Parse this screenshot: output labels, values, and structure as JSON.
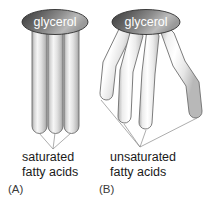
{
  "figure": {
    "background_color": "#ffffff",
    "width": 207,
    "height": 205
  },
  "panels": [
    {
      "id": "A",
      "panel_label": "(A)",
      "head": {
        "label": "glycerol",
        "shape": "ellipse",
        "fill_dark": "#4a4a4a",
        "fill_light": "#b4b4b4",
        "text_color": "#ffffff",
        "cx": 55,
        "cy": 22,
        "rx": 33,
        "ry": 12
      },
      "tails": {
        "count": 3,
        "type": "straight",
        "description": "straight parallel hydrocarbon chains packed closely together",
        "fill_light": "#f2f2f2",
        "fill_mid": "#c8c8c8",
        "stroke": "#6e6e6e"
      },
      "caption_line1": "saturated",
      "caption_line2": "fatty acids"
    },
    {
      "id": "B",
      "panel_label": "(B)",
      "head": {
        "label": "glycerol",
        "shape": "ellipse",
        "fill_dark": "#4a4a4a",
        "fill_light": "#b4b4b4",
        "text_color": "#ffffff",
        "cx": 146,
        "cy": 22,
        "rx": 34,
        "ry": 12
      },
      "tails": {
        "count": 4,
        "type": "kinked",
        "description": "kinked hydrocarbon chains with cis double bonds splaying outward",
        "fill_light": "#fbfbfb",
        "fill_mid": "#cfcfcf",
        "stroke": "#6e6e6e"
      },
      "caption_line1": "unsaturated",
      "caption_line2": "fatty acids"
    }
  ],
  "leader_lines": {
    "color": "#8a8a8a",
    "width": 0.7,
    "panel_a_apex": [
      53,
      148
    ],
    "panel_b_apex": [
      140,
      146
    ]
  }
}
